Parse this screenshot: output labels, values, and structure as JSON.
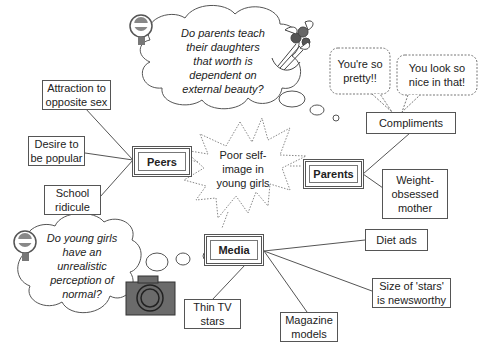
{
  "diagram": {
    "central_topic": "Poor self-image in young girls",
    "central_lines": [
      "Poor self-",
      "image in",
      "young girls"
    ],
    "hubs": {
      "peers": "Peers",
      "parents": "Parents",
      "media": "Media"
    },
    "peers_items": [
      {
        "lines": [
          "Attraction to",
          "opposite sex"
        ]
      },
      {
        "lines": [
          "Desire to",
          "be popular"
        ]
      },
      {
        "lines": [
          "School",
          "ridicule"
        ]
      }
    ],
    "parents_items": [
      {
        "lines": [
          "Compliments"
        ]
      },
      {
        "lines": [
          "Weight-",
          "obsessed",
          "mother"
        ]
      }
    ],
    "media_items": [
      {
        "lines": [
          "Diet ads"
        ]
      },
      {
        "lines": [
          "Size of 'stars'",
          "is newsworthy"
        ]
      },
      {
        "lines": [
          "Magazine",
          "models"
        ]
      },
      {
        "lines": [
          "Thin TV",
          "stars"
        ]
      }
    ],
    "thought_bubbles": {
      "top": [
        "Do parents teach",
        "their daughters",
        "that worth is",
        "dependent on",
        "external beauty?"
      ],
      "bottom": [
        "Do young girls",
        "have an",
        "unrealistic",
        "perception of",
        "normal?"
      ]
    },
    "speech_bubbles": {
      "left": [
        "You're so",
        "pretty!!"
      ],
      "right": [
        "You look so",
        "nice in that!"
      ]
    },
    "icons": {
      "idea": "lightbulb-icon",
      "flowers": "bouquet-icon",
      "camera": "camera-icon"
    },
    "colors": {
      "line": "#555555",
      "camera_body": "#6b6b6b",
      "background": "#ffffff"
    }
  }
}
